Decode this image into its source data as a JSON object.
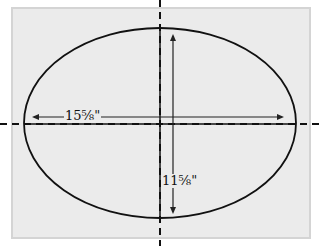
{
  "diagram": {
    "background_color": "#ebebeb",
    "border_color": "#d4d4d4",
    "line_color": "#111111",
    "width_label": "15⅝\"",
    "height_label": "11⅝\""
  }
}
